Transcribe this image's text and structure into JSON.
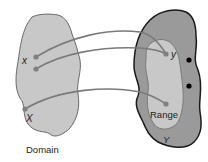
{
  "diagram": {
    "type": "function-mapping",
    "domain_set": {
      "caption": "Domain",
      "set_label": "X",
      "element_label": "x",
      "fill": "#c8c8c8",
      "stroke": "#6a6a6a"
    },
    "codomain_set": {
      "set_label": "Y",
      "element_label": "y",
      "fill": "#9a9a9a",
      "stroke": "#1a1a1a"
    },
    "range_set": {
      "caption": "Range",
      "fill": "#c8c8c8",
      "stroke": "#7a7a7a"
    },
    "arrows": [
      {
        "from": "x-upper",
        "to": "y"
      },
      {
        "from": "x-lower",
        "to": "y"
      },
      {
        "from": "domain-lower-point",
        "to": "range-lower-point"
      }
    ],
    "colors": {
      "arrow": "#7a7a7a",
      "point": "#808080",
      "unmapped_point": "#000000"
    }
  }
}
